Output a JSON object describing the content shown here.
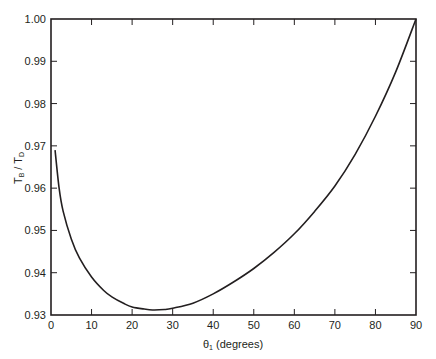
{
  "chart_data": {
    "type": "line",
    "title": "",
    "xlabel": "θ1 (degrees)",
    "xlabel_parts": {
      "symbol": "θ",
      "subscript": "1",
      "rest": " (degrees)"
    },
    "ylabel": "TB / TD",
    "ylabel_parts": {
      "t1": "T",
      "s1": "B",
      "sep": " / ",
      "t2": "T",
      "s2": "D"
    },
    "xlim": [
      0,
      90
    ],
    "ylim": [
      0.93,
      1.0
    ],
    "x_ticks": [
      "0",
      "10",
      "20",
      "30",
      "40",
      "50",
      "60",
      "70",
      "80",
      "90"
    ],
    "y_ticks": [
      "0.93",
      "0.94",
      "0.95",
      "0.96",
      "0.97",
      "0.98",
      "0.99",
      "1.00"
    ],
    "grid": false,
    "legend": null,
    "series": [
      {
        "name": "TB/TD",
        "x": [
          1,
          2,
          3,
          5,
          7,
          10,
          13,
          15,
          18,
          20,
          23,
          25,
          28,
          30,
          35,
          40,
          45,
          50,
          55,
          60,
          65,
          70,
          75,
          80,
          85,
          90
        ],
        "values": [
          0.969,
          0.96,
          0.9545,
          0.948,
          0.9435,
          0.939,
          0.9358,
          0.9343,
          0.9327,
          0.9319,
          0.9314,
          0.9312,
          0.9313,
          0.9316,
          0.9328,
          0.935,
          0.9378,
          0.941,
          0.9448,
          0.9492,
          0.9545,
          0.9605,
          0.968,
          0.977,
          0.9875,
          1.0
        ]
      }
    ]
  }
}
